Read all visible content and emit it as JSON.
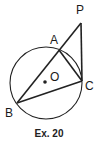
{
  "diagram": {
    "caption": "Ex. 20",
    "circle": {
      "center_label": "O",
      "cx": 46,
      "cy": 83,
      "r": 37
    },
    "points": {
      "P": {
        "label": "P",
        "x": 81,
        "y": 23
      },
      "A": {
        "label": "A",
        "x": 59,
        "y": 50
      },
      "B": {
        "label": "B",
        "x": 17,
        "y": 103
      },
      "C": {
        "label": "C",
        "x": 82,
        "y": 81
      },
      "O": {
        "label": "O",
        "x": 45,
        "y": 82
      }
    },
    "segments": [
      "BP",
      "PC",
      "AC",
      "BC"
    ]
  }
}
